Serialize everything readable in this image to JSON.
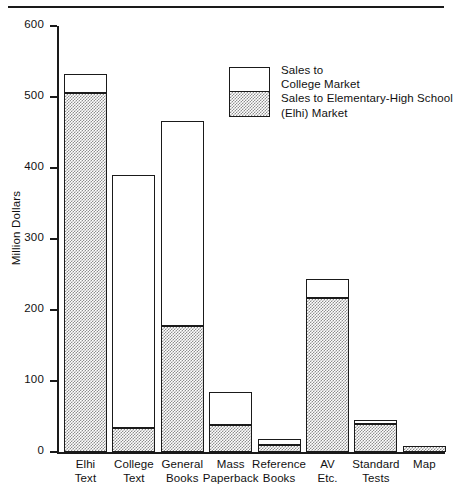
{
  "chart_data": {
    "type": "bar",
    "title": "",
    "subtitle": "",
    "xlabel": "",
    "ylabel": "Million Dollars",
    "ylim": [
      0,
      600
    ],
    "yticks": [
      0,
      100,
      200,
      300,
      400,
      500,
      600
    ],
    "grid": false,
    "stacked": true,
    "legend_position": "inside-top-right",
    "categories": [
      "Elhi Text",
      "College Text",
      "General Books",
      "Mass Paperback",
      "Reference Books",
      "AV Etc.",
      "Standard Tests",
      "Map"
    ],
    "category_lines": [
      [
        "Elhi",
        "Text"
      ],
      [
        "College",
        "Text"
      ],
      [
        "General",
        "Books"
      ],
      [
        "Mass",
        "Paperback"
      ],
      [
        "Reference",
        "Books"
      ],
      [
        "AV",
        "Etc."
      ],
      [
        "Standard",
        "Tests"
      ],
      [
        "Map",
        ""
      ]
    ],
    "series": [
      {
        "name": "Sales to Elementary-High School (Elhi) Market",
        "short_name": "Elhi",
        "values": [
          505,
          34,
          177,
          38,
          10,
          217,
          40,
          8
        ]
      },
      {
        "name": "Sales to College Market",
        "short_name": "College",
        "values": [
          28,
          356,
          289,
          47,
          8,
          26,
          5,
          0
        ]
      }
    ],
    "totals": [
      533,
      390,
      466,
      85,
      18,
      243,
      45,
      8
    ]
  },
  "legend": {
    "lines": [
      "Sales to",
      "College Market",
      "Sales to Elementary-High School",
      "(Elhi) Market"
    ],
    "swatch_top_label": "Sales to College Market",
    "swatch_bottom_label": "Sales to Elementary-High School (Elhi) Market"
  },
  "colors": {
    "ink": "#1a1a1a",
    "background": "#ffffff",
    "college_fill": "#ffffff",
    "elhi_fill": "#8e8e8e"
  }
}
